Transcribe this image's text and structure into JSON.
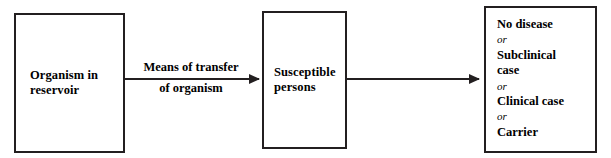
{
  "diagram": {
    "type": "flow-chain",
    "background_color": "#ffffff",
    "stroke_color": "#231f20",
    "text_color": "#000000",
    "nodes": [
      {
        "id": "reservoir",
        "lines": [
          "Organism in",
          "reservoir"
        ],
        "text": "Organism in reservoir"
      },
      {
        "id": "susceptible",
        "lines": [
          "Susceptible",
          "persons"
        ],
        "text": "Susceptible persons"
      },
      {
        "id": "outcomes",
        "text": "No disease or Subclinical case or Clinical case or Carrier",
        "items": [
          {
            "kind": "outcome",
            "label": "No disease"
          },
          {
            "kind": "connector",
            "label": "or"
          },
          {
            "kind": "outcome",
            "label": "Subclinical"
          },
          {
            "kind": "outcome",
            "label": "case"
          },
          {
            "kind": "connector",
            "label": "or"
          },
          {
            "kind": "outcome",
            "label": "Clinical case"
          },
          {
            "kind": "connector",
            "label": "or"
          },
          {
            "kind": "outcome",
            "label": "Carrier"
          }
        ]
      }
    ],
    "arrows": [
      {
        "id": "transfer",
        "from": "reservoir",
        "to": "susceptible",
        "label_lines": [
          "Means of transfer",
          "of organism"
        ],
        "label": "Means of transfer of organism"
      },
      {
        "id": "outcome",
        "from": "susceptible",
        "to": "outcomes",
        "label_lines": [],
        "label": ""
      }
    ]
  }
}
